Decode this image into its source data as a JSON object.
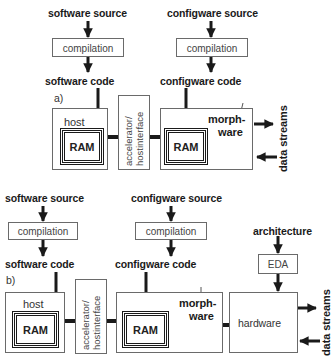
{
  "diagram_a": {
    "label": "a)",
    "software_source": "software source",
    "software_compilation": "compilation",
    "software_code": "software code",
    "configware_source": "configware source",
    "configware_compilation": "compilation",
    "configware_code": "configware code",
    "host": "host",
    "host_ram": "RAM",
    "accelerator_line1": "accelerator/",
    "accelerator_line2": "hostinterface",
    "morphware_line1": "morph-",
    "morphware_line2": "ware",
    "morphware_ram": "RAM",
    "data_streams": "data streams"
  },
  "diagram_b": {
    "label": "b)",
    "software_source": "software source",
    "software_compilation": "compilation",
    "software_code": "software code",
    "configware_source": "configware source",
    "configware_compilation": "compilation",
    "configware_code": "configware code",
    "architecture": "architecture",
    "eda": "EDA",
    "host": "host",
    "host_ram": "RAM",
    "accelerator_line1": "accelerator/",
    "accelerator_line2": "hostinterface",
    "morphware_line1": "morph-",
    "morphware_line2": "ware",
    "morphware_ram": "RAM",
    "hardware": "hardware",
    "data_streams": "data streams"
  },
  "colors": {
    "ink": "#1a1a1a",
    "box_border": "#6a6a6a",
    "background": "#ffffff"
  }
}
